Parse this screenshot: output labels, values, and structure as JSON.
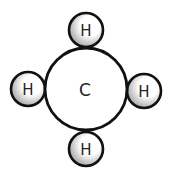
{
  "diagram": {
    "type": "molecule",
    "molecule": "methane",
    "colors": {
      "outline": "#111111",
      "fill": "#ffffff",
      "shading": "#9a9a9a",
      "text": "#222222"
    },
    "central_atom": {
      "label": "C",
      "cx": 86,
      "cy": 89,
      "r": 41
    },
    "atoms": [
      {
        "label": "H",
        "position": "top",
        "cx": 86,
        "cy": 30,
        "r": 17
      },
      {
        "label": "H",
        "position": "left",
        "cx": 28,
        "cy": 89,
        "r": 17
      },
      {
        "label": "H",
        "position": "right",
        "cx": 144,
        "cy": 91,
        "r": 17
      },
      {
        "label": "H",
        "position": "bottom",
        "cx": 86,
        "cy": 149,
        "r": 17
      }
    ]
  }
}
